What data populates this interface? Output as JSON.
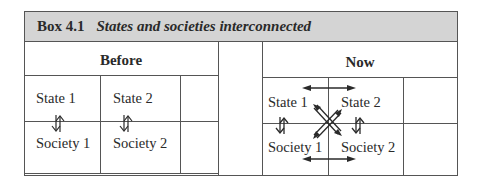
{
  "box": {
    "number": "Box 4.1",
    "title": "States and societies interconnected"
  },
  "panels": {
    "before": {
      "heading": "Before",
      "state1": "State 1",
      "state2": "State 2",
      "society1": "Society 1",
      "society2": "Society 2"
    },
    "now": {
      "heading": "Now",
      "state1": "State 1",
      "state2": "State 2",
      "society1": "Society 1",
      "society2": "Society 2"
    }
  },
  "colors": {
    "header_bg": "#d4d4d4",
    "line": "#555555",
    "text": "#2a2a2a"
  }
}
